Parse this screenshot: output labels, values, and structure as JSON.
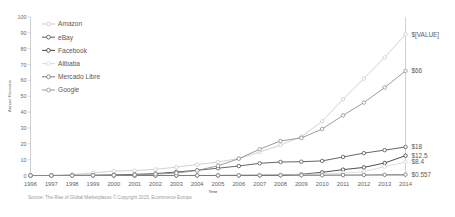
{
  "chart_data": {
    "type": "line",
    "title": "",
    "xlabel": "Year",
    "ylabel": "Annual Revenue",
    "ylim": [
      0,
      100
    ],
    "yticks": [
      0,
      10,
      20,
      30,
      40,
      50,
      60,
      70,
      80,
      90,
      100
    ],
    "grid": false,
    "legend_position": "top-left",
    "categories": [
      "1996",
      "1997",
      "1998",
      "1999",
      "2000",
      "2001",
      "2002",
      "2003",
      "2004",
      "2005",
      "2006",
      "2007",
      "2008",
      "2009",
      "2010",
      "2011",
      "2012",
      "2013",
      "2014"
    ],
    "series": [
      {
        "name": "Amazon",
        "color": "#c9c9c9",
        "marker": "circle",
        "values": [
          0.0,
          0.1,
          0.6,
          1.6,
          2.8,
          3.1,
          3.9,
          5.3,
          6.9,
          8.5,
          10.7,
          14.8,
          19.2,
          24.5,
          34.2,
          48.1,
          61.1,
          74.5,
          89.0
        ]
      },
      {
        "name": "eBay",
        "color": "#4a4a4a",
        "marker": "circle",
        "values": [
          0.0,
          0.0,
          0.1,
          0.2,
          0.4,
          0.7,
          1.2,
          2.2,
          3.3,
          4.6,
          6.0,
          7.7,
          8.5,
          8.7,
          9.2,
          11.7,
          14.1,
          16.0,
          18.0
        ]
      },
      {
        "name": "Facebook",
        "color": "#2f2f2f",
        "marker": "circle",
        "values": [
          0.0,
          0.0,
          0.0,
          0.0,
          0.0,
          0.0,
          0.0,
          0.0,
          0.0,
          0.0,
          0.05,
          0.15,
          0.27,
          0.78,
          2.0,
          3.7,
          5.1,
          7.9,
          12.5
        ]
      },
      {
        "name": "Alibaba",
        "color": "#d6d6d6",
        "marker": "circle",
        "values": [
          0.0,
          0.0,
          0.0,
          0.0,
          0.0,
          0.0,
          0.0,
          0.0,
          0.07,
          0.1,
          0.17,
          0.3,
          0.45,
          0.7,
          1.0,
          1.5,
          2.4,
          5.6,
          8.4
        ]
      },
      {
        "name": "Mercado Libre",
        "color": "#6e6e6e",
        "marker": "circle",
        "values": [
          0.0,
          0.0,
          0.0,
          0.0,
          0.0,
          0.0,
          0.0,
          0.01,
          0.02,
          0.03,
          0.05,
          0.08,
          0.14,
          0.17,
          0.22,
          0.3,
          0.37,
          0.47,
          0.557
        ]
      },
      {
        "name": "Google",
        "color": "#8a8a8a",
        "marker": "circle",
        "values": [
          0.0,
          0.0,
          0.0,
          0.1,
          0.2,
          0.4,
          0.9,
          1.5,
          3.2,
          6.1,
          10.6,
          16.6,
          21.8,
          23.7,
          29.3,
          37.9,
          46.0,
          55.5,
          66.0
        ]
      }
    ],
    "end_labels": [
      {
        "text": "$[VALUE]",
        "value": 89.0
      },
      {
        "text": "$66",
        "value": 66.0
      },
      {
        "text": "$18",
        "value": 18.0
      },
      {
        "text": "$12.5",
        "value": 12.5
      },
      {
        "text": "$8.4",
        "value": 8.4
      },
      {
        "text": "$0.557",
        "value": 0.557
      }
    ]
  },
  "legend": {
    "items": [
      {
        "label": "Amazon"
      },
      {
        "label": "eBay"
      },
      {
        "label": "Facebook"
      },
      {
        "label": "Alibaba"
      },
      {
        "label": "Mercado Libre"
      },
      {
        "label": "Google"
      }
    ]
  },
  "footer": {
    "source": "Source: The Rise of Global Marketplaces  © Copyright 2015, Ecommerce Europe"
  },
  "axis": {
    "y_title": "Annual Revenue",
    "x_title": "Year"
  }
}
